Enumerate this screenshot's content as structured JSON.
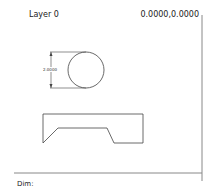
{
  "status": {
    "layer": "Layer 0",
    "coordinates": "0.0000,0.0000",
    "command_prompt": "Dim:"
  },
  "drawing": {
    "dimension_label": "2.0000",
    "line_color": "#444444",
    "frame_color": "#888888"
  }
}
